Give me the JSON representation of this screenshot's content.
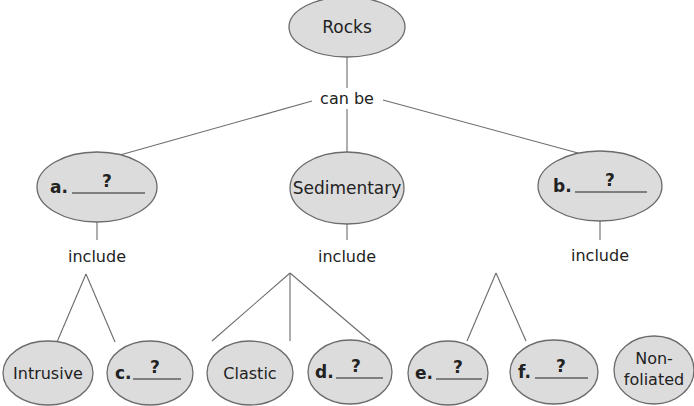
{
  "diagram": {
    "type": "concept-map",
    "root": {
      "label": "Rocks"
    },
    "root_link": "can be",
    "level2": [
      {
        "letter": "a.",
        "answer": "?",
        "link": "include"
      },
      {
        "label": "Sedimentary",
        "link": "include"
      },
      {
        "letter": "b.",
        "answer": "?",
        "link": "include"
      }
    ],
    "leaves": [
      {
        "label": "Intrusive"
      },
      {
        "letter": "c.",
        "answer": "?"
      },
      {
        "label": "Clastic"
      },
      {
        "letter": "d.",
        "answer": "?"
      },
      {
        "letter": "e.",
        "answer": "?"
      },
      {
        "letter": "f.",
        "answer": "?"
      },
      {
        "label_line1": "Non-",
        "label_line2": "foliated"
      }
    ],
    "colors": {
      "node_fill": "#dcdcdc",
      "stroke": "#6b6b6b",
      "text": "#222222"
    }
  }
}
